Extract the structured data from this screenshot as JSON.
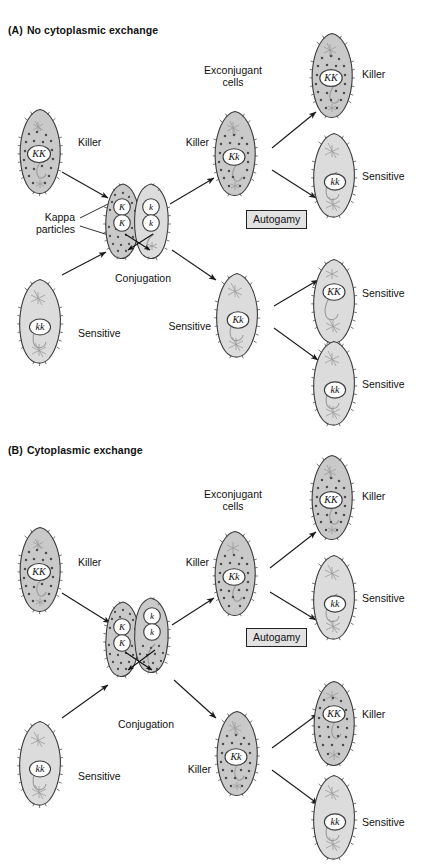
{
  "figure": {
    "title_visible": false,
    "background": "#ffffff",
    "colors": {
      "killer_cytoplasm": "#c9c9c9",
      "sensitive_cytoplasm": "#dcdcdc",
      "kappa_particle": "#4c4c4c",
      "cell_outline": "#3b3b3b",
      "nucleus_fill": "#fdfdfd",
      "arrow": "#1b1b1b",
      "autogamy_box_fill": "#e2e2e2",
      "autogamy_box_border": "#222222",
      "text": "#111111"
    }
  },
  "panels": [
    {
      "id": "A",
      "prefix": "(A)",
      "heading": "No cytoplasmic exchange",
      "stage_labels": {
        "exconjugant": "Exconjugant\ncells",
        "exconjugant_line1": "Exconjugant",
        "exconjugant_line2": "cells",
        "conjugation": "Conjugation",
        "kappa_line1": "Kappa",
        "kappa_line2": "particles",
        "autogamy": "Autogamy"
      },
      "cells": [
        {
          "name": "parent-killer",
          "genotype": "KK",
          "phenotype": "Killer",
          "kappa": true,
          "column": "parent",
          "row": "top"
        },
        {
          "name": "parent-sensitive",
          "genotype": "kk",
          "phenotype": "Sensitive",
          "kappa": false,
          "column": "parent",
          "row": "bottom"
        },
        {
          "name": "conjugant-left",
          "genotype": "K / K",
          "nuclei": [
            "K",
            "K"
          ],
          "kappa": true,
          "column": "conjugation",
          "row": "pair-left"
        },
        {
          "name": "conjugant-right",
          "genotype": "k / k",
          "nuclei": [
            "k",
            "k"
          ],
          "kappa": false,
          "column": "conjugation",
          "row": "pair-right"
        },
        {
          "name": "exconjugant-killer",
          "genotype": "Kk",
          "phenotype": "Killer",
          "kappa": true,
          "column": "exconjugant",
          "row": "top"
        },
        {
          "name": "exconjugant-sensitive",
          "genotype": "Kk",
          "phenotype": "Sensitive",
          "kappa": false,
          "column": "exconjugant",
          "row": "bottom"
        },
        {
          "name": "autogamy-1",
          "genotype": "KK",
          "phenotype": "Killer",
          "kappa": true,
          "column": "autogamy",
          "row": "1"
        },
        {
          "name": "autogamy-2",
          "genotype": "kk",
          "phenotype": "Sensitive",
          "kappa": false,
          "column": "autogamy",
          "row": "2"
        },
        {
          "name": "autogamy-3",
          "genotype": "KK",
          "phenotype": "Sensitive",
          "kappa": false,
          "column": "autogamy",
          "row": "3"
        },
        {
          "name": "autogamy-4",
          "genotype": "kk",
          "phenotype": "Sensitive",
          "kappa": false,
          "column": "autogamy",
          "row": "4"
        }
      ]
    },
    {
      "id": "B",
      "prefix": "(B)",
      "heading": "Cytoplasmic exchange",
      "stage_labels": {
        "exconjugant_line1": "Exconjugant",
        "exconjugant_line2": "cells",
        "conjugation": "Conjugation",
        "autogamy": "Autogamy"
      },
      "cells": [
        {
          "name": "parent-killer",
          "genotype": "KK",
          "phenotype": "Killer",
          "kappa": true,
          "column": "parent",
          "row": "top"
        },
        {
          "name": "parent-sensitive",
          "genotype": "kk",
          "phenotype": "Sensitive",
          "kappa": false,
          "column": "parent",
          "row": "bottom"
        },
        {
          "name": "conjugant-left",
          "genotype": "K / K",
          "nuclei": [
            "K",
            "K"
          ],
          "kappa": true,
          "column": "conjugation",
          "row": "pair-left"
        },
        {
          "name": "conjugant-right",
          "genotype": "k / k",
          "nuclei": [
            "k",
            "k"
          ],
          "kappa": true,
          "column": "conjugation",
          "row": "pair-right"
        },
        {
          "name": "exconjugant-killer",
          "genotype": "Kk",
          "phenotype": "Killer",
          "kappa": true,
          "column": "exconjugant",
          "row": "top"
        },
        {
          "name": "exconjugant-killer-2",
          "genotype": "Kk",
          "phenotype": "Killer",
          "kappa": true,
          "column": "exconjugant",
          "row": "bottom"
        },
        {
          "name": "autogamy-1",
          "genotype": "KK",
          "phenotype": "Killer",
          "kappa": true,
          "column": "autogamy",
          "row": "1"
        },
        {
          "name": "autogamy-2",
          "genotype": "kk",
          "phenotype": "Sensitive",
          "kappa": false,
          "column": "autogamy",
          "row": "2"
        },
        {
          "name": "autogamy-3",
          "genotype": "KK",
          "phenotype": "Killer",
          "kappa": true,
          "column": "autogamy",
          "row": "3"
        },
        {
          "name": "autogamy-4",
          "genotype": "kk",
          "phenotype": "Sensitive",
          "kappa": false,
          "column": "autogamy",
          "row": "4"
        }
      ]
    }
  ],
  "a": {
    "heading_prefix": "(A)",
    "heading_text": "No cytoplasmic exchange",
    "parent_killer_g": "KK",
    "parent_killer_p": "Killer",
    "parent_sens_g": "kk",
    "parent_sens_p": "Sensitive",
    "conj_n1": "K",
    "conj_n2": "K",
    "conj_n3": "k",
    "conj_n4": "k",
    "kappa_l1": "Kappa",
    "kappa_l2": "particles",
    "conjugation": "Conjugation",
    "exconj_l1": "Exconjugant",
    "exconj_l2": "cells",
    "ex_top_g": "Kk",
    "ex_top_p": "Killer",
    "ex_bot_g": "Kk",
    "ex_bot_p": "Sensitive",
    "autogamy": "Autogamy",
    "out1_g": "KK",
    "out1_p": "Killer",
    "out2_g": "kk",
    "out2_p": "Sensitive",
    "out3_g": "KK",
    "out3_p": "Sensitive",
    "out4_g": "kk",
    "out4_p": "Sensitive"
  },
  "b": {
    "heading_prefix": "(B)",
    "heading_text": "Cytoplasmic exchange",
    "parent_killer_g": "KK",
    "parent_killer_p": "Killer",
    "parent_sens_g": "kk",
    "parent_sens_p": "Sensitive",
    "conj_n1": "K",
    "conj_n2": "K",
    "conj_n3": "k",
    "conj_n4": "k",
    "conjugation": "Conjugation",
    "exconj_l1": "Exconjugant",
    "exconj_l2": "cells",
    "ex_top_g": "Kk",
    "ex_top_p": "Killer",
    "ex_bot_g": "Kk",
    "ex_bot_p": "Killer",
    "autogamy": "Autogamy",
    "out1_g": "KK",
    "out1_p": "Killer",
    "out2_g": "kk",
    "out2_p": "Sensitive",
    "out3_g": "KK",
    "out3_p": "Killer",
    "out4_g": "kk",
    "out4_p": "Sensitive"
  }
}
